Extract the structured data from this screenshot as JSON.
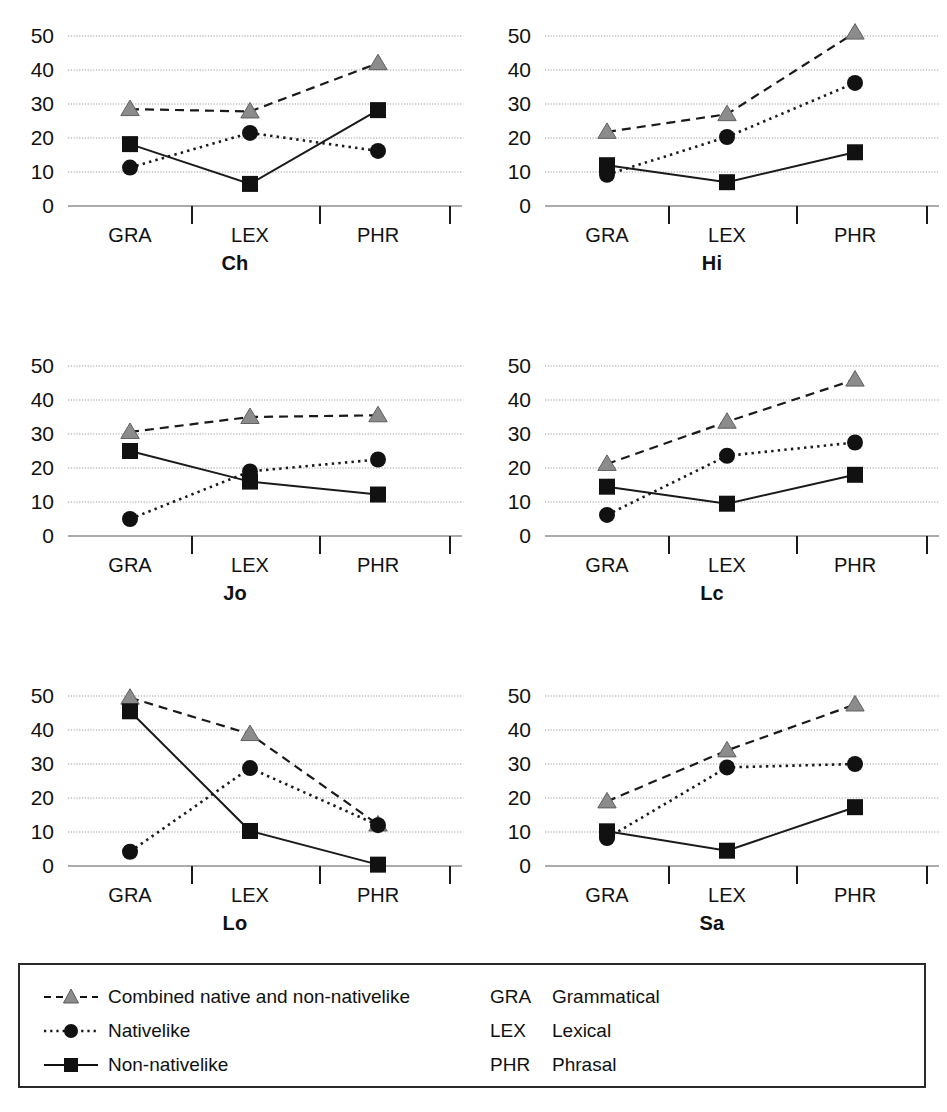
{
  "figure": {
    "panel_order": [
      "Ch",
      "Hi",
      "Jo",
      "Lc",
      "Lo",
      "Sa"
    ]
  },
  "legend": {
    "series": [
      {
        "label": "Combined native and non-nativelike",
        "marker": "triangle-marker",
        "line": "dashed",
        "color": "#808080"
      },
      {
        "label": "Nativelike",
        "marker": "circle-marker",
        "line": "dotted",
        "color": "#111111"
      },
      {
        "label": "Non-nativelike",
        "marker": "square-marker",
        "line": "solid",
        "color": "#111111"
      }
    ],
    "abbreviations": [
      {
        "key": "GRA",
        "value": "Grammatical"
      },
      {
        "key": "LEX",
        "value": "Lexical"
      },
      {
        "key": "PHR",
        "value": "Phrasal"
      }
    ]
  },
  "chart_data": [
    {
      "type": "line",
      "title": "Ch",
      "xlabel": "",
      "ylabel": "",
      "categories": [
        "GRA",
        "LEX",
        "PHR"
      ],
      "ylim": [
        0,
        50
      ],
      "yticks": [
        0,
        10,
        20,
        30,
        40,
        50
      ],
      "grid": true,
      "legend_position": "bottom",
      "series": [
        {
          "name": "Combined native and non-nativelike",
          "values": [
            28.5,
            27.8,
            42.0
          ]
        },
        {
          "name": "Nativelike",
          "values": [
            11.3,
            21.5,
            16.2
          ]
        },
        {
          "name": "Non-nativelike",
          "values": [
            18.2,
            6.5,
            28.2
          ]
        }
      ]
    },
    {
      "type": "line",
      "title": "Hi",
      "xlabel": "",
      "ylabel": "",
      "categories": [
        "GRA",
        "LEX",
        "PHR"
      ],
      "ylim": [
        0,
        50
      ],
      "yticks": [
        0,
        10,
        20,
        30,
        40,
        50
      ],
      "grid": true,
      "legend_position": "bottom",
      "series": [
        {
          "name": "Combined native and non-nativelike",
          "values": [
            21.8,
            27.0,
            51.0
          ]
        },
        {
          "name": "Nativelike",
          "values": [
            9.2,
            20.3,
            36.2
          ]
        },
        {
          "name": "Non-nativelike",
          "values": [
            12.0,
            7.0,
            15.8
          ]
        }
      ]
    },
    {
      "type": "line",
      "title": "Jo",
      "xlabel": "",
      "ylabel": "",
      "categories": [
        "GRA",
        "LEX",
        "PHR"
      ],
      "ylim": [
        0,
        50
      ],
      "yticks": [
        0,
        10,
        20,
        30,
        40,
        50
      ],
      "grid": true,
      "legend_position": "bottom",
      "series": [
        {
          "name": "Combined native and non-nativelike",
          "values": [
            30.6,
            35.0,
            35.5
          ]
        },
        {
          "name": "Nativelike",
          "values": [
            5.0,
            19.0,
            22.5
          ]
        },
        {
          "name": "Non-nativelike",
          "values": [
            25.0,
            16.0,
            12.2
          ]
        }
      ]
    },
    {
      "type": "line",
      "title": "Lc",
      "xlabel": "",
      "ylabel": "",
      "categories": [
        "GRA",
        "LEX",
        "PHR"
      ],
      "ylim": [
        0,
        50
      ],
      "yticks": [
        0,
        10,
        20,
        30,
        40,
        50
      ],
      "grid": true,
      "legend_position": "bottom",
      "series": [
        {
          "name": "Combined native and non-nativelike",
          "values": [
            21.2,
            33.6,
            46.0
          ]
        },
        {
          "name": "Nativelike",
          "values": [
            6.2,
            23.6,
            27.5
          ]
        },
        {
          "name": "Non-nativelike",
          "values": [
            14.5,
            9.5,
            18.0
          ]
        }
      ]
    },
    {
      "type": "line",
      "title": "Lo",
      "xlabel": "",
      "ylabel": "",
      "categories": [
        "GRA",
        "LEX",
        "PHR"
      ],
      "ylim": [
        0,
        50
      ],
      "yticks": [
        0,
        10,
        20,
        30,
        40,
        50
      ],
      "grid": true,
      "legend_position": "bottom",
      "series": [
        {
          "name": "Combined native and non-nativelike",
          "values": [
            49.5,
            38.8,
            12.2
          ]
        },
        {
          "name": "Nativelike",
          "values": [
            4.2,
            28.8,
            12.0
          ]
        },
        {
          "name": "Non-nativelike",
          "values": [
            45.5,
            10.3,
            0.4
          ]
        }
      ]
    },
    {
      "type": "line",
      "title": "Sa",
      "xlabel": "",
      "ylabel": "",
      "categories": [
        "GRA",
        "LEX",
        "PHR"
      ],
      "ylim": [
        0,
        50
      ],
      "yticks": [
        0,
        10,
        20,
        30,
        40,
        50
      ],
      "grid": true,
      "legend_position": "bottom",
      "series": [
        {
          "name": "Combined native and non-nativelike",
          "values": [
            19.0,
            34.0,
            47.5
          ]
        },
        {
          "name": "Nativelike",
          "values": [
            8.2,
            29.0,
            30.0
          ]
        },
        {
          "name": "Non-nativelike",
          "values": [
            10.2,
            4.5,
            17.3
          ]
        }
      ]
    }
  ]
}
